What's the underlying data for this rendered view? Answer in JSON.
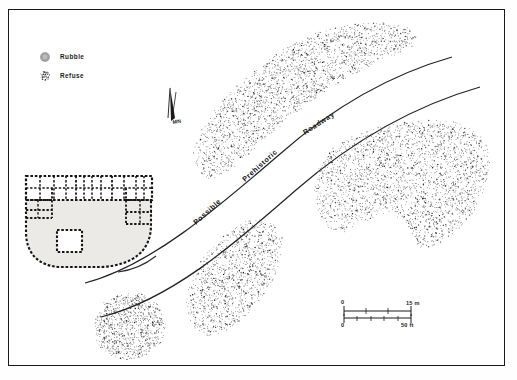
{
  "figure": {
    "kind": "archaeological-site-map",
    "frame": {
      "stroke": "#1a1a1a"
    },
    "background": "#ffffff"
  },
  "legend": {
    "items": [
      {
        "symbol": "rubble-swatch",
        "label": "Rubble",
        "fill": "#9a9a9a"
      },
      {
        "symbol": "refuse-swatch",
        "label": "Refuse",
        "fill": "#4a4a4a"
      }
    ]
  },
  "north_arrow": {
    "label": "MN",
    "name": "magnetic-north-arrow"
  },
  "roadway": {
    "words": [
      "Possible",
      "Prehistoric",
      "Roadway"
    ],
    "corridor_label": "Possible Prehistoric Roadway",
    "line_color": "#222222"
  },
  "structure": {
    "name": "great-house-roomblock",
    "wall_color": "#1a1a1a",
    "plaza_fill": "#eceae6",
    "features": [
      "roomblock-grid",
      "d-shaped-enclosure",
      "kiva"
    ]
  },
  "mounds": [
    {
      "name": "refuse-mound-north",
      "dots": 2300
    },
    {
      "name": "refuse-mound-east",
      "dots": 2600
    },
    {
      "name": "refuse-mound-center",
      "dots": 1250
    },
    {
      "name": "refuse-mound-southwest",
      "dots": 950
    }
  ],
  "scale_bars": [
    {
      "units": "m",
      "zero": "0",
      "max_label": "15 m",
      "value": 15
    },
    {
      "units": "ft",
      "zero": "0",
      "max_label": "50 ft",
      "value": 50
    }
  ],
  "chart_data": {
    "type": "scatter",
    "xlabel": "",
    "ylabel": "",
    "legend": [
      "Rubble",
      "Refuse"
    ],
    "annotations": [
      "Possible",
      "Prehistoric",
      "Roadway",
      "MN",
      "0",
      "15 m",
      "0",
      "50 ft"
    ]
  }
}
